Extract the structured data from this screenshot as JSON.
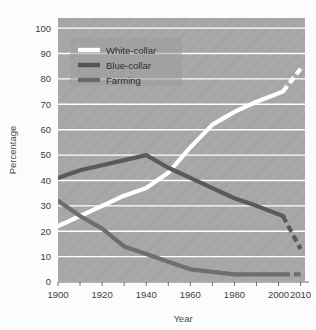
{
  "figure": {
    "background_color": "#fdfdfd",
    "plot_background_color": "#a8a8a8",
    "gridline_color": "#ffffff",
    "faint_header_text": ""
  },
  "chart_data": {
    "type": "line",
    "title": "",
    "xlabel": "Year",
    "ylabel": "Percentage",
    "xlim": [
      1900,
      2012
    ],
    "ylim": [
      0,
      104
    ],
    "grid": "horizontal",
    "legend_position": "top-left-inside",
    "x_tick_labels": [
      "1900",
      "1920",
      "1940",
      "1960",
      "1980",
      "2000",
      "2010"
    ],
    "x_tick_values": [
      1900,
      1920,
      1940,
      1960,
      1980,
      2000,
      2010
    ],
    "x_minor_ticks": [
      1900,
      1910,
      1920,
      1930,
      1940,
      1950,
      1960,
      1970,
      1980,
      1990,
      2000,
      2010
    ],
    "y_tick_labels": [
      "0",
      "10",
      "20",
      "30",
      "40",
      "50",
      "60",
      "70",
      "80",
      "90",
      "100"
    ],
    "y_tick_values": [
      0,
      10,
      20,
      30,
      40,
      50,
      60,
      70,
      80,
      90,
      100
    ],
    "projection_note": "Dashed line segments after 2002 represent projected values",
    "series": [
      {
        "name": "White-collar",
        "color": "#ffffff",
        "x": [
          1900,
          1910,
          1920,
          1930,
          1940,
          1950,
          1960,
          1970,
          1980,
          1990,
          2002
        ],
        "values": [
          22,
          26,
          30,
          34,
          37,
          43,
          53,
          62,
          67,
          71,
          75
        ],
        "projected_x": [
          2002,
          2010
        ],
        "projected_values": [
          75,
          84
        ]
      },
      {
        "name": "Blue-collar",
        "color": "#5a5a5a",
        "x": [
          1900,
          1910,
          1920,
          1930,
          1940,
          1950,
          1960,
          1970,
          1980,
          1990,
          2002
        ],
        "values": [
          41,
          44,
          46,
          48,
          50,
          45,
          41,
          37,
          33,
          30,
          26
        ],
        "projected_x": [
          2002,
          2010
        ],
        "projected_values": [
          26,
          13
        ]
      },
      {
        "name": "Farming",
        "color": "#6e6e6e",
        "x": [
          1900,
          1910,
          1920,
          1930,
          1940,
          1950,
          1960,
          1970,
          1980,
          1990,
          2002
        ],
        "values": [
          32,
          26,
          21,
          14,
          11,
          8,
          5,
          4,
          3,
          3,
          3
        ],
        "projected_x": [
          2002,
          2010
        ],
        "projected_values": [
          3,
          3
        ]
      }
    ]
  },
  "legend": {
    "items": [
      {
        "label": "White-collar",
        "color": "#ffffff"
      },
      {
        "label": "Blue-collar",
        "color": "#545454"
      },
      {
        "label": "Farming",
        "color": "#6a6a6a"
      }
    ]
  }
}
